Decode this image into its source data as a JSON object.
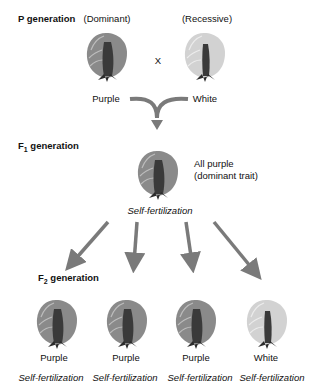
{
  "p_generation": {
    "label": "P generation",
    "dominant_label": "(Dominant)",
    "recessive_label": "(Recessive)",
    "cross_symbol": "X",
    "left_flower": {
      "color_label": "Purple",
      "shade": "purple"
    },
    "right_flower": {
      "color_label": "White",
      "shade": "white"
    }
  },
  "f1_generation": {
    "label_prefix": "F",
    "label_sub": "1",
    "label_suffix": " generation",
    "flower": {
      "shade": "purple"
    },
    "note_line1": "All purple",
    "note_line2": "(dominant trait)",
    "process": "Self-fertilization"
  },
  "f2_generation": {
    "label_prefix": "F",
    "label_sub": "2",
    "label_suffix": " generation",
    "flowers": [
      {
        "color_label": "Purple",
        "process": "Self-fertilization",
        "shade": "purple"
      },
      {
        "color_label": "Purple",
        "process": "Self-fertilization",
        "shade": "purple"
      },
      {
        "color_label": "Purple",
        "process": "Self-fertilization",
        "shade": "purple"
      },
      {
        "color_label": "White",
        "process": "Self-fertilization",
        "shade": "white"
      }
    ]
  },
  "colors": {
    "arrow": "#7a7a7a",
    "purple_petal": "#8a8a8a",
    "white_petal": "#d2d2d2",
    "sepal": "#2b2b2b"
  }
}
